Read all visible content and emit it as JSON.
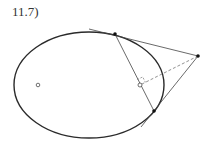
{
  "figure": {
    "label": "11.7)",
    "colors": {
      "ellipse": "#2a2a2a",
      "lines": "#444444",
      "dashed": "#777777",
      "points": "#111111"
    },
    "ellipse": {
      "cx": 89,
      "cy": 85,
      "rx": 75,
      "ry": 53
    },
    "focus_left": {
      "x": 38,
      "y": 85
    },
    "external_point": {
      "x": 198,
      "y": 56
    },
    "tangent_point_top": {
      "x": 115,
      "y": 34
    },
    "tangent_point_bottom": {
      "x": 154,
      "y": 111
    },
    "chord_foot_point": {
      "x": 140,
      "y": 85
    },
    "tangent_top_extension": {
      "x": 89,
      "y": 29
    },
    "tangent_bottom_extension": {
      "x": 141,
      "y": 127
    }
  }
}
